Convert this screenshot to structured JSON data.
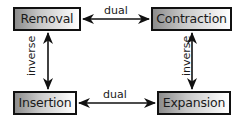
{
  "diagram": {
    "nodes": [
      {
        "id": "removal",
        "label": "Removal"
      },
      {
        "id": "contraction",
        "label": "Contraction"
      },
      {
        "id": "insertion",
        "label": "Insertion"
      },
      {
        "id": "expansion",
        "label": "Expansion"
      }
    ],
    "edges": [
      {
        "from": "removal",
        "to": "contraction",
        "label": "dual",
        "direction": "bidirectional"
      },
      {
        "from": "insertion",
        "to": "expansion",
        "label": "dual",
        "direction": "bidirectional"
      },
      {
        "from": "removal",
        "to": "insertion",
        "label": "inverse",
        "direction": "bidirectional"
      },
      {
        "from": "contraction",
        "to": "expansion",
        "label": "inverse",
        "direction": "bidirectional"
      }
    ],
    "colors": {
      "border": "#111111",
      "gradient_start": "#8c8c8c",
      "gradient_end": "#ffffff",
      "arrow": "#111111",
      "text": "#1a1a1a"
    }
  }
}
